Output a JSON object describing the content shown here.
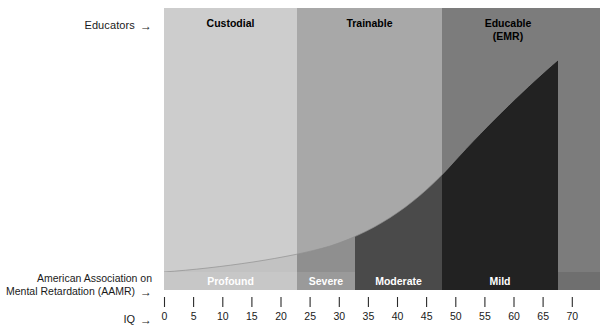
{
  "annotations": {
    "educators": "Educators",
    "educators_arrow": "→",
    "aamr_line1": "American Association on",
    "aamr_line2": "Mental Retardation (AAMR)",
    "aamr_arrow": "→",
    "iq_label": "IQ",
    "iq_arrow": "→"
  },
  "chart_data": {
    "type": "area",
    "title": "",
    "subtitle": "",
    "xlabel": "IQ",
    "ylabel": "",
    "xlim": [
      0,
      70
    ],
    "ylim": [
      0,
      100
    ],
    "grid": false,
    "legend_position": "none",
    "x_ticks": [
      0,
      5,
      10,
      15,
      20,
      25,
      30,
      35,
      40,
      45,
      50,
      55,
      60,
      65,
      70
    ],
    "x_tick_labels": [
      "0",
      "5",
      "10",
      "15",
      "20",
      "25",
      "30",
      "35",
      "40",
      "45",
      "50",
      "55",
      "60",
      "65",
      "70"
    ],
    "series": [
      {
        "name": "Proportion of population (cumulative severity curve)",
        "x": [
          0,
          5,
          10,
          15,
          20,
          25,
          30,
          35,
          40,
          45,
          50,
          55,
          60,
          65,
          68
        ],
        "values": [
          2,
          3,
          4,
          5,
          7,
          9,
          12,
          16,
          21,
          28,
          37,
          49,
          64,
          85,
          100
        ]
      }
    ],
    "educator_bands": [
      {
        "label": "Custodial",
        "range": [
          0,
          25
        ],
        "color": "#cdcdcd",
        "text_color": "#000000"
      },
      {
        "label": "Trainable",
        "range": [
          25,
          50
        ],
        "color": "#a8a8a8",
        "text_color": "#000000"
      },
      {
        "label": "Educable\n(EMR)",
        "label_line1": "Educable",
        "label_line2": "(EMR)",
        "range": [
          50,
          72
        ],
        "color": "#7c7c7c",
        "text_color": "#000000"
      }
    ],
    "aamr_bands": [
      {
        "label": "Profound",
        "range": [
          0,
          25
        ],
        "color": "#cdcdcd"
      },
      {
        "label": "Severe",
        "range": [
          25,
          35
        ],
        "color": "#9a9a9a"
      },
      {
        "label": "Moderate",
        "range": [
          35,
          50
        ],
        "color": "#4a4a4a"
      },
      {
        "label": "Mild",
        "range": [
          50,
          68
        ],
        "color": "#222222"
      }
    ],
    "curve_fill_color": "#222222",
    "plot_background_color": "#cdcdcd"
  }
}
